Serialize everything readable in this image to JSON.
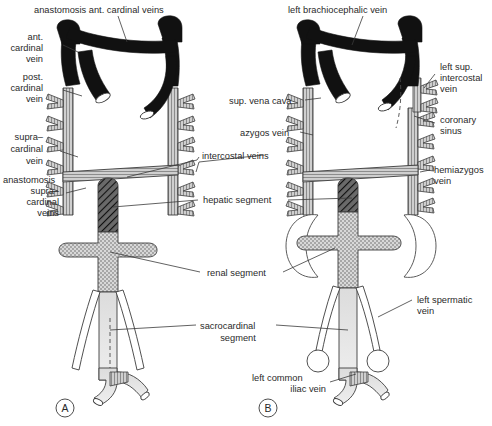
{
  "figure": {
    "panels": [
      {
        "id": "A",
        "name": "panel-a",
        "caption": "A"
      },
      {
        "id": "B",
        "name": "panel-b",
        "caption": "B"
      }
    ],
    "colors": {
      "vein_dark": "#111111",
      "vessel_outline": "#3c3c3c",
      "leader_line": "#3a3a3a",
      "text": "#2a2a2a",
      "background": "#ffffff",
      "hepatic_hatch": "#4f4f4f",
      "renal_stipple": "#b9b9b9",
      "sacrocardinal_light": "#e3e3e3"
    }
  },
  "labels_panel_a": {
    "anastomosis_ant_cardinal": "anastomosis ant. cardinal veins",
    "ant_cardinal_vein": "ant.\ncardinal\nvein",
    "ant_cardinal_vein_lines": [
      "ant.",
      "cardinal",
      "vein"
    ],
    "post_cardinal_vein_lines": [
      "post.",
      "cardinal",
      "vein"
    ],
    "supracardinal_vein_lines": [
      "supra–",
      "cardinal",
      "vein"
    ],
    "anastomosis_supracardinal_lines": [
      "anastomosis",
      "supra–",
      "cardinal",
      "veins"
    ],
    "panel_caption": "A"
  },
  "labels_center": {
    "intercostal_veins": "intercostal veins",
    "hepatic_segment": "hepatic segment",
    "renal_segment": "renal segment",
    "sacrocardinal_segment_lines": [
      "sacrocardinal",
      "segment"
    ]
  },
  "labels_panel_b": {
    "left_brachiocephalic_vein": "left brachiocephalic vein",
    "sup_vena_cava": "sup. vena cava",
    "azygos_vein": "azygos vein",
    "left_sup_intercostal_lines": [
      "left sup.",
      "intercostal",
      "vein"
    ],
    "coronary_sinus_lines": [
      "coronary",
      "sinus"
    ],
    "hemiazygos_vein_lines": [
      "hemiazygos",
      "vein"
    ],
    "left_spermatic_vein_lines": [
      "left spermatic",
      "vein"
    ],
    "left_common_iliac_lines": [
      "left common",
      "iliac vein"
    ],
    "panel_caption": "B"
  }
}
